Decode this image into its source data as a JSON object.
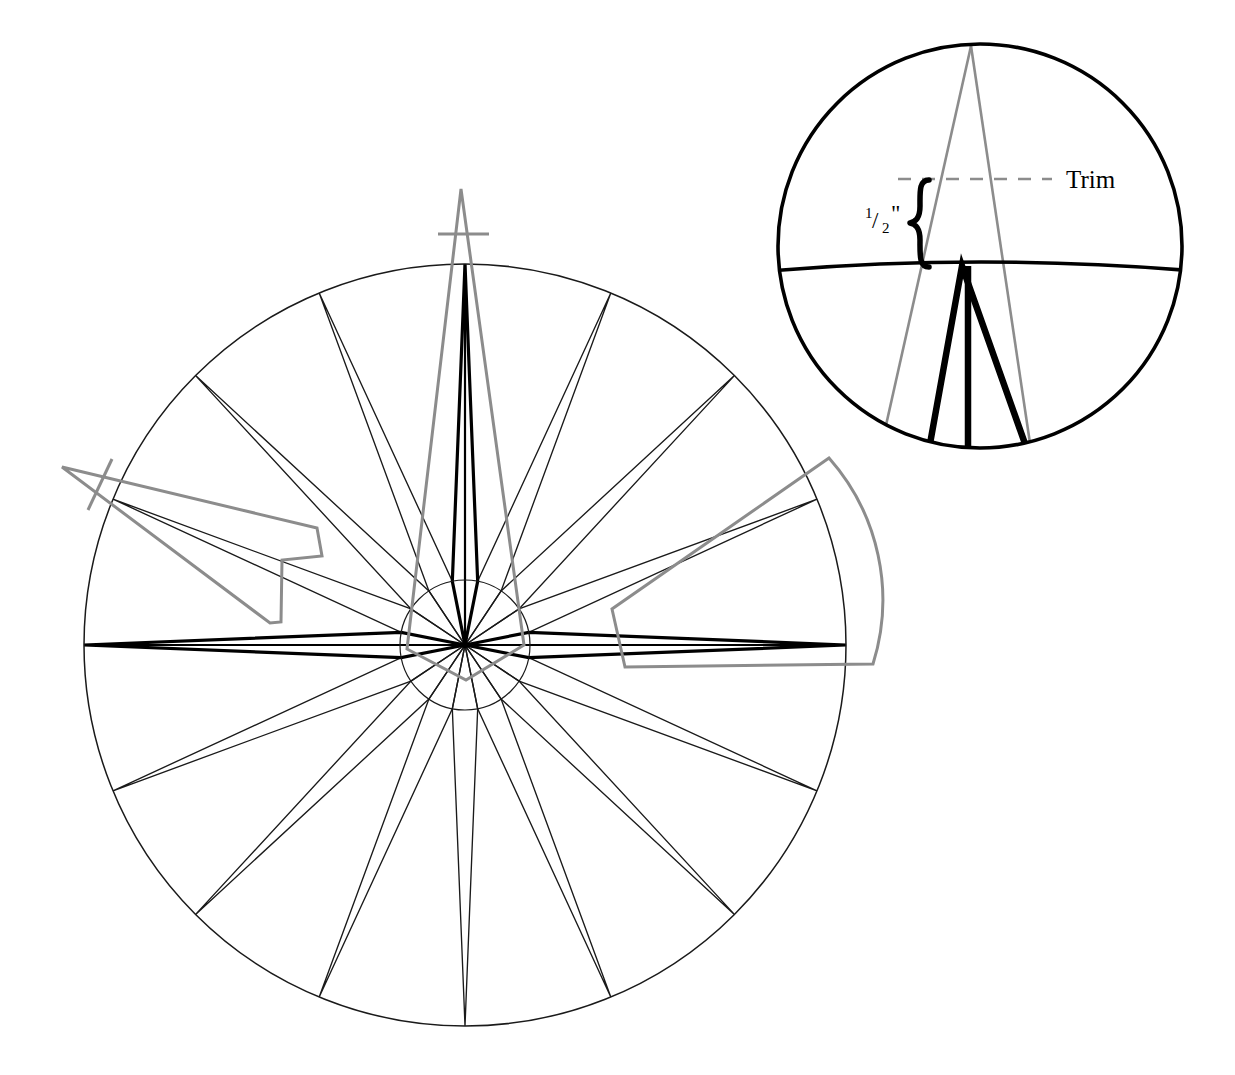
{
  "document": {
    "title": "Compass Rose Construction Drawing",
    "kind": "technical-line-drawing",
    "background_color": "#ffffff"
  },
  "colors": {
    "construction_line": "#1a1a1a",
    "bold_line": "#000000",
    "overlay_gray": "#8c8c8c",
    "dashed_gray": "#8c8c8c",
    "text": "#000000"
  },
  "annotations": {
    "trim_label": "Trim",
    "measure_numerator": "1",
    "measure_bar": "/",
    "measure_denominator": "2",
    "measure_unit": "\"",
    "measure_full": "1/2\"",
    "brace_glyph": "{"
  },
  "chart_data": {
    "type": "diagram",
    "main_circle": {
      "center_x": 465,
      "center_y": 645,
      "radius": 381,
      "stroke": "#1a1a1a",
      "stroke_width": 1.4
    },
    "inner_hub_circle": {
      "center_x": 465,
      "center_y": 645,
      "radius": 65,
      "stroke": "#1a1a1a",
      "stroke_width": 1.1
    },
    "points": {
      "count": 16,
      "cardinal_count": 4,
      "intercardinal_count": 4,
      "secondary_count": 8,
      "angles_deg": [
        0,
        22.5,
        45,
        67.5,
        90,
        112.5,
        135,
        157.5,
        180,
        202.5,
        225,
        247.5,
        270,
        292.5,
        315,
        337.5
      ],
      "shoulder_radius": 65,
      "shoulder_offset_deg": 11.25
    },
    "bold_points_deg": [
      90,
      0,
      180
    ],
    "detail_circle": {
      "center_x": 980,
      "center_y": 246,
      "radius": 203,
      "stroke": "#000000",
      "stroke_width": 3.4,
      "shows": "north tip of rose, trim line, 1/2 inch allowance"
    },
    "detail_trim_line": {
      "y": 178,
      "x_start": 900,
      "x_end": 1055,
      "style": "dashed",
      "color": "#8c8c8c"
    },
    "detail_rose_arc": {
      "y_at_center": 268,
      "note": "magnified segment of main circle edge"
    },
    "overlays": [
      {
        "name": "north-template",
        "shape": "triangle-with-tick",
        "color": "#8c8c8c"
      },
      {
        "name": "east-template",
        "shape": "curved-fan-segment",
        "color": "#8c8c8c"
      },
      {
        "name": "west-template",
        "shape": "stepped-polygon-with-tick",
        "color": "#8c8c8c"
      }
    ]
  },
  "elements": {
    "main_rose_name": "compass-rose",
    "detail_name": "detail-callout-circle"
  }
}
